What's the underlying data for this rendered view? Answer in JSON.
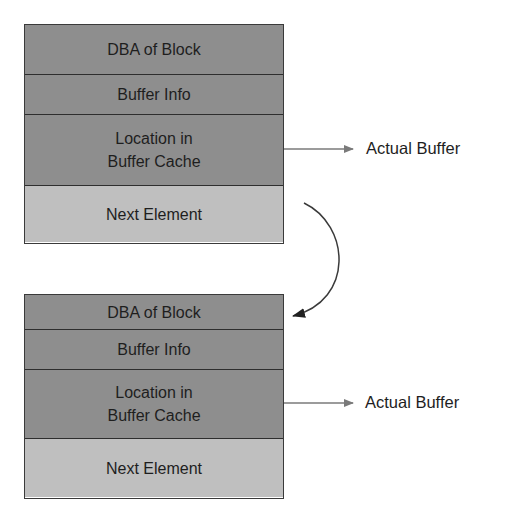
{
  "diagram": {
    "elements": [
      {
        "rows": [
          {
            "label": "DBA of Block"
          },
          {
            "label": "Buffer Info"
          },
          {
            "label": "Location in\nBuffer Cache"
          },
          {
            "label": "Next Element"
          }
        ],
        "pointer_label": "Actual Buffer"
      },
      {
        "rows": [
          {
            "label": "DBA of Block"
          },
          {
            "label": "Buffer Info"
          },
          {
            "label": "Location in\nBuffer Cache"
          },
          {
            "label": "Next Element"
          }
        ],
        "pointer_label": "Actual Buffer"
      }
    ],
    "colors": {
      "field_fill": "#8e8e8e",
      "next_fill": "#bfbfbf",
      "border": "#2e2e2e",
      "arrow": "#7a7a7a",
      "curve": "#3a3a3a"
    }
  }
}
